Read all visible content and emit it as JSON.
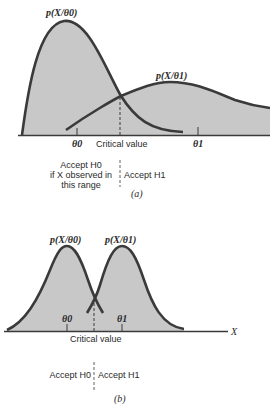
{
  "panel_a": {
    "curve_label_h0": "p(X/θ0)",
    "curve_label_h1": "p(X/θ1)",
    "tick_theta0": "θ0",
    "tick_critical": "Critical value",
    "tick_theta1": "θ1",
    "accept_h0_line1": "Accept H0",
    "accept_h0_line2": "if X observed in",
    "accept_h0_line3": "this range",
    "accept_h1": "Accept H1",
    "caption": "(a)"
  },
  "panel_b": {
    "curve_label_h0": "p(X/θ0)",
    "curve_label_h1": "p(X/θ1)",
    "tick_theta0": "θ0",
    "tick_theta1": "θ1",
    "tick_critical": "Critical value",
    "axis_label": "X",
    "accept_h0": "Accept H0",
    "accept_h1": "Accept H1",
    "caption": "(b)"
  },
  "colors": {
    "fill": "#c8c8c8",
    "stroke": "#3a3a3a"
  }
}
